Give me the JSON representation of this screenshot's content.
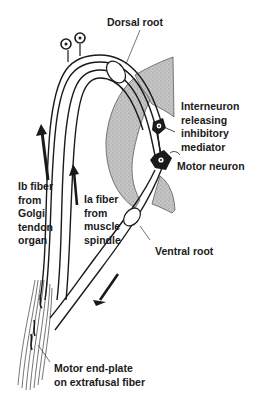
{
  "diagram": {
    "labels": {
      "dorsal_root": "Dorsal root",
      "interneuron": [
        "Interneuron",
        "releasing",
        "inhibitory",
        "mediator"
      ],
      "motor_neuron": "Motor neuron",
      "ib_fiber": [
        "Ib fiber",
        "from",
        "Golgi",
        "tendon",
        "organ"
      ],
      "ia_fiber": [
        "Ia fiber",
        "from",
        "muscle",
        "spindle"
      ],
      "ventral_root": "Ventral root",
      "motor_end_plate": [
        "Motor end-plate",
        "on extrafusal fiber"
      ]
    },
    "colors": {
      "ink": "#1a1a1a",
      "gray_matter": "#b8b8b8",
      "background": "#ffffff"
    },
    "icons": {
      "cell_body": "sensory-ganglion-cell-icon",
      "arrow": "signal-direction-arrow-icon"
    }
  }
}
